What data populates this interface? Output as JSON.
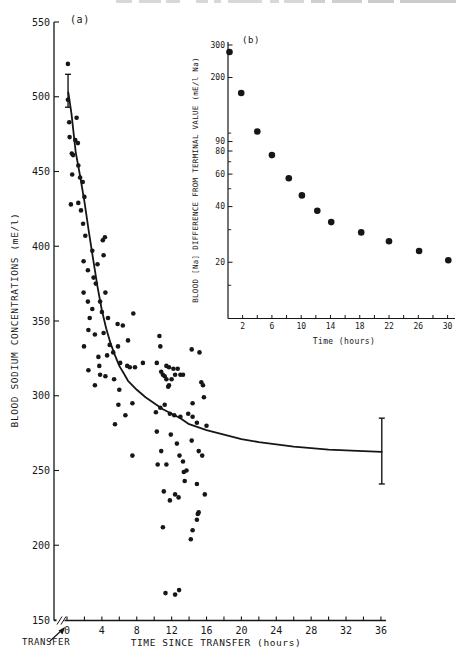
{
  "figure": {
    "background": "#ffffff",
    "ink": "#161616",
    "panel_a": {
      "label": "(a)",
      "xlabel": "TIME SINCE TRANSFER  (hours)",
      "ylabel": "BLOOD  SODIUM  CONCENTRATIONS  (mE/l)",
      "annotation": "TRANSFER"
    },
    "panel_b": {
      "label": "(b)",
      "xlabel": "Time (hours)",
      "ylabel": "BLOOD [Na] DIFFERENCE FROM TERMINAL VALUE (mE/l Na)"
    }
  },
  "chart_data": [
    {
      "id": "main",
      "type": "scatter",
      "panel_label": "(a)",
      "title": "",
      "xlabel": "TIME SINCE TRANSFER  (hours)",
      "ylabel": "BLOOD  SODIUM  CONCENTRATIONS  (mE/l)",
      "annotation": "TRANSFER",
      "xlim": [
        0,
        36
      ],
      "ylim": [
        150,
        550
      ],
      "x_tick_labels": [
        0,
        4,
        8,
        12,
        16,
        20,
        24,
        28,
        32,
        36
      ],
      "x_minor_step": 2,
      "y_tick_labels": [
        150,
        200,
        250,
        300,
        350,
        400,
        450,
        500,
        550
      ],
      "axis_break_before_zero": true,
      "grid": false,
      "error_bars": [
        {
          "x": 0.12,
          "y": 504,
          "half_height": 11
        },
        {
          "x": 36.1,
          "y": 263,
          "half_height": 22
        }
      ],
      "curve": [
        [
          0.15,
          503
        ],
        [
          0.5,
          489
        ],
        [
          1,
          463
        ],
        [
          1.5,
          447
        ],
        [
          2,
          430
        ],
        [
          2.5,
          410
        ],
        [
          3,
          391
        ],
        [
          3.5,
          373
        ],
        [
          4,
          357
        ],
        [
          4.5,
          345
        ],
        [
          5,
          335
        ],
        [
          5.5,
          327
        ],
        [
          6,
          320
        ],
        [
          6.5,
          315
        ],
        [
          7,
          310
        ],
        [
          7.5,
          307
        ],
        [
          8,
          304
        ],
        [
          9,
          299
        ],
        [
          10,
          295
        ],
        [
          11,
          291
        ],
        [
          12,
          288
        ],
        [
          13,
          285
        ],
        [
          14,
          281
        ],
        [
          15,
          279
        ],
        [
          16,
          277
        ],
        [
          17,
          275.5
        ],
        [
          18,
          274
        ],
        [
          20,
          271
        ],
        [
          22,
          269
        ],
        [
          24,
          267.5
        ],
        [
          26,
          266
        ],
        [
          28,
          265
        ],
        [
          30,
          264
        ],
        [
          32,
          263.5
        ],
        [
          34,
          263
        ],
        [
          36.1,
          262.5
        ]
      ],
      "points": [
        [
          0.1,
          522
        ],
        [
          0.1,
          498
        ],
        [
          0.25,
          483
        ],
        [
          0.3,
          473
        ],
        [
          0.45,
          428
        ],
        [
          0.55,
          462
        ],
        [
          0.6,
          448
        ],
        [
          0.7,
          461
        ],
        [
          0.95,
          471
        ],
        [
          1.1,
          486
        ],
        [
          1.25,
          469
        ],
        [
          1.3,
          454
        ],
        [
          1.3,
          429
        ],
        [
          1.5,
          446
        ],
        [
          1.6,
          424
        ],
        [
          1.8,
          443
        ],
        [
          1.85,
          415
        ],
        [
          1.9,
          390
        ],
        [
          1.9,
          369
        ],
        [
          1.95,
          333
        ],
        [
          2.0,
          433
        ],
        [
          2.1,
          407
        ],
        [
          2.4,
          384
        ],
        [
          2.4,
          363
        ],
        [
          2.45,
          344
        ],
        [
          2.45,
          317
        ],
        [
          2.6,
          352
        ],
        [
          2.9,
          397
        ],
        [
          2.9,
          358
        ],
        [
          3.05,
          379
        ],
        [
          3.2,
          341
        ],
        [
          3.2,
          307
        ],
        [
          3.3,
          375
        ],
        [
          3.5,
          388
        ],
        [
          3.6,
          326
        ],
        [
          3.7,
          320
        ],
        [
          3.8,
          363
        ],
        [
          3.8,
          314
        ],
        [
          4.0,
          356
        ],
        [
          4.1,
          404
        ],
        [
          4.2,
          394
        ],
        [
          4.2,
          342
        ],
        [
          4.35,
          406
        ],
        [
          4.4,
          369
        ],
        [
          4.4,
          313
        ],
        [
          4.6,
          327
        ],
        [
          4.7,
          352
        ],
        [
          4.9,
          334
        ],
        [
          5.3,
          329
        ],
        [
          5.4,
          311
        ],
        [
          5.5,
          281
        ],
        [
          5.8,
          348
        ],
        [
          5.85,
          333
        ],
        [
          5.9,
          294
        ],
        [
          6.0,
          304
        ],
        [
          6.1,
          322
        ],
        [
          6.4,
          347
        ],
        [
          6.7,
          287
        ],
        [
          6.9,
          320
        ],
        [
          7.0,
          337
        ],
        [
          7.2,
          319
        ],
        [
          7.5,
          295
        ],
        [
          7.5,
          260
        ],
        [
          7.6,
          355
        ],
        [
          7.8,
          319
        ],
        [
          8.7,
          322
        ],
        [
          10.2,
          289
        ],
        [
          10.3,
          322
        ],
        [
          10.3,
          276
        ],
        [
          10.4,
          254
        ],
        [
          10.6,
          340
        ],
        [
          10.7,
          333
        ],
        [
          10.7,
          292
        ],
        [
          10.8,
          316
        ],
        [
          10.8,
          263
        ],
        [
          11.0,
          314
        ],
        [
          11.0,
          212
        ],
        [
          11.1,
          236
        ],
        [
          11.2,
          313
        ],
        [
          11.2,
          294
        ],
        [
          11.3,
          168
        ],
        [
          11.4,
          320
        ],
        [
          11.4,
          311
        ],
        [
          11.4,
          254
        ],
        [
          11.6,
          306
        ],
        [
          11.7,
          319
        ],
        [
          11.7,
          307
        ],
        [
          11.8,
          288
        ],
        [
          11.8,
          230
        ],
        [
          11.9,
          274
        ],
        [
          12.0,
          311
        ],
        [
          12.2,
          318
        ],
        [
          12.3,
          287
        ],
        [
          12.4,
          314
        ],
        [
          12.4,
          234
        ],
        [
          12.4,
          167
        ],
        [
          12.6,
          268
        ],
        [
          12.7,
          318
        ],
        [
          12.8,
          232
        ],
        [
          12.85,
          170
        ],
        [
          12.9,
          260
        ],
        [
          13.0,
          314
        ],
        [
          13.0,
          286
        ],
        [
          13.3,
          314
        ],
        [
          13.3,
          256
        ],
        [
          13.4,
          249
        ],
        [
          13.5,
          243
        ],
        [
          13.7,
          250
        ],
        [
          13.9,
          288
        ],
        [
          14.2,
          204
        ],
        [
          14.3,
          331
        ],
        [
          14.3,
          270
        ],
        [
          14.4,
          295
        ],
        [
          14.4,
          286
        ],
        [
          14.4,
          210
        ],
        [
          14.9,
          282
        ],
        [
          14.9,
          241
        ],
        [
          14.9,
          217
        ],
        [
          15.0,
          221
        ],
        [
          15.1,
          263
        ],
        [
          15.1,
          222
        ],
        [
          15.2,
          329
        ],
        [
          15.4,
          309
        ],
        [
          15.5,
          260
        ],
        [
          15.6,
          307
        ],
        [
          15.7,
          299
        ],
        [
          15.8,
          234
        ],
        [
          16.0,
          280
        ]
      ]
    },
    {
      "id": "inset",
      "type": "scatter",
      "panel_label": "(b)",
      "title": "",
      "xlabel": "Time (hours)",
      "ylabel": "BLOOD [Na] DIFFERENCE FROM TERMINAL VALUE (mE/l Na)",
      "yscale": "log",
      "xlim": [
        0,
        31
      ],
      "ylim": [
        10,
        300
      ],
      "x_tick_labels": [
        2,
        6,
        10,
        14,
        18,
        22,
        26,
        30
      ],
      "x_minor_step": 2,
      "y_tick_labels": [
        300,
        200,
        90,
        80,
        60,
        40,
        20
      ],
      "y_minor_ticks": [
        100,
        70,
        50,
        30,
        15
      ],
      "grid": false,
      "points": [
        [
          0.2,
          275
        ],
        [
          1.8,
          165
        ],
        [
          4,
          102
        ],
        [
          6,
          76
        ],
        [
          8.3,
          57
        ],
        [
          10.1,
          46
        ],
        [
          12.2,
          38
        ],
        [
          14.1,
          33
        ],
        [
          18.2,
          29
        ],
        [
          22,
          26
        ],
        [
          26.1,
          23
        ],
        [
          30.1,
          20.5
        ]
      ]
    }
  ]
}
